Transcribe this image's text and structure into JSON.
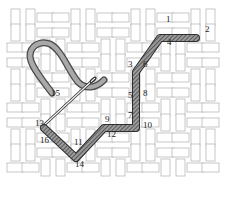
{
  "diagram": {
    "type": "embroidery-stitch-diagram",
    "canvas": {
      "pattern": "basketweave",
      "grid_color": "#b8b8b8",
      "fill_color": "#ffffff",
      "x0": 8,
      "y0": 10,
      "x1": 222,
      "y1": 178,
      "cell": 15
    },
    "stitch_color": "#6e6e6e",
    "thread_color": "#8a8a8a",
    "needle_color": "#555555",
    "stitch_path": [
      {
        "from": "1",
        "to": "2"
      },
      {
        "from": "3",
        "to": "4"
      },
      {
        "from": "5",
        "to": "6"
      },
      {
        "from": "7",
        "to": "8"
      },
      {
        "from": "9",
        "to": "10"
      },
      {
        "from": "11",
        "to": "12"
      },
      {
        "from": "13",
        "to": "14"
      },
      {
        "from": "15",
        "to": "16"
      }
    ],
    "labels": [
      {
        "text": "1",
        "x": 166,
        "y": 22
      },
      {
        "text": "2",
        "x": 205,
        "y": 32
      },
      {
        "text": "3",
        "x": 128,
        "y": 67
      },
      {
        "text": "4",
        "x": 167,
        "y": 45
      },
      {
        "text": "5",
        "x": 128,
        "y": 98
      },
      {
        "text": "6",
        "x": 143,
        "y": 67
      },
      {
        "text": "7",
        "x": 128,
        "y": 118
      },
      {
        "text": "8",
        "x": 143,
        "y": 96
      },
      {
        "text": "9",
        "x": 105,
        "y": 122
      },
      {
        "text": "10",
        "x": 143,
        "y": 128
      },
      {
        "text": "11",
        "x": 74,
        "y": 145
      },
      {
        "text": "12",
        "x": 107,
        "y": 137
      },
      {
        "text": "13",
        "x": 35,
        "y": 126
      },
      {
        "text": "14",
        "x": 75,
        "y": 167
      },
      {
        "text": "15",
        "x": 51,
        "y": 96
      },
      {
        "text": "16",
        "x": 40,
        "y": 143
      }
    ]
  }
}
